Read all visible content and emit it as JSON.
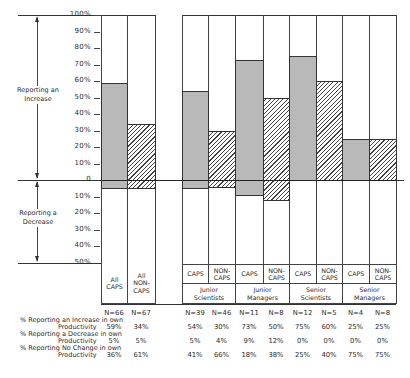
{
  "chart_data": {
    "type": "bar",
    "title": "",
    "xlabel": "",
    "ylabel": "",
    "y_axis": {
      "increase_ticks": [
        "100%",
        "90%",
        "80%",
        "70%",
        "60%",
        "50%",
        "40%",
        "30%",
        "20%",
        "10%"
      ],
      "zero_label": "0",
      "decrease_ticks": [
        "10%",
        "20%",
        "30%",
        "40%",
        "50%"
      ],
      "range_increase": [
        0,
        100
      ],
      "range_decrease": [
        0,
        50
      ]
    },
    "side_annotations": {
      "increase": "Reporting an Increase",
      "decrease": "Reporting a Decrease"
    },
    "legend": {
      "caps_fill": "gray",
      "noncaps_fill": "hatched"
    },
    "categories": [
      {
        "label": "All CAPS",
        "group": "",
        "type": "CAPS",
        "n": "N=66",
        "increase": 59,
        "decrease": 5,
        "no_change": 36
      },
      {
        "label": "All NON-CAPS",
        "group": "",
        "type": "NON-CAPS",
        "n": "N=67",
        "increase": 34,
        "decrease": 5,
        "no_change": 61
      },
      {
        "label": "CAPS",
        "group": "Junior Scientists",
        "type": "CAPS",
        "n": "N=39",
        "increase": 54,
        "decrease": 5,
        "no_change": 41
      },
      {
        "label": "NON-CAPS",
        "group": "Junior Scientists",
        "type": "NON-CAPS",
        "n": "N=46",
        "increase": 30,
        "decrease": 4,
        "no_change": 66
      },
      {
        "label": "CAPS",
        "group": "Junior Managers",
        "type": "CAPS",
        "n": "N=11",
        "increase": 73,
        "decrease": 9,
        "no_change": 18
      },
      {
        "label": "NON-CAPS",
        "group": "Junior Managers",
        "type": "NON-CAPS",
        "n": "N=8",
        "increase": 50,
        "decrease": 12,
        "no_change": 38
      },
      {
        "label": "CAPS",
        "group": "Senior Scientists",
        "type": "CAPS",
        "n": "N=12",
        "increase": 75,
        "decrease": 0,
        "no_change": 25
      },
      {
        "label": "NON-CAPS",
        "group": "Senior Scientists",
        "type": "NON-CAPS",
        "n": "N=5",
        "increase": 60,
        "decrease": 0,
        "no_change": 40
      },
      {
        "label": "CAPS",
        "group": "Senior Managers",
        "type": "CAPS",
        "n": "N=4",
        "increase": 25,
        "decrease": 0,
        "no_change": 75
      },
      {
        "label": "NON-CAPS",
        "group": "Senior Managers",
        "type": "NON-CAPS",
        "n": "N=8",
        "increase": 25,
        "decrease": 0,
        "no_change": 75
      }
    ],
    "table": {
      "rows": [
        {
          "label_line1": "% Reporting an Increase in own",
          "label_line2": "Productivity",
          "values": [
            "59%",
            "34%",
            "54%",
            "30%",
            "73%",
            "50%",
            "75%",
            "60%",
            "25%",
            "25%"
          ]
        },
        {
          "label_line1": "% Reporting a Decrease in own",
          "label_line2": "Productivity",
          "values": [
            "5%",
            "5%",
            "5%",
            "4%",
            "9%",
            "12%",
            "0%",
            "0%",
            "0%",
            "0%"
          ]
        },
        {
          "label_line1": "% Reporting No Change in own",
          "label_line2": "Productivity",
          "values": [
            "36%",
            "61%",
            "41%",
            "66%",
            "18%",
            "38%",
            "25%",
            "40%",
            "75%",
            "75%"
          ]
        }
      ],
      "n_values": [
        "N=66",
        "N=67",
        "N=39",
        "N=46",
        "N=11",
        "N=8",
        "N=12",
        "N=5",
        "N=4",
        "N=8"
      ]
    },
    "groups": [
      "Junior Scientists",
      "Junior Managers",
      "Senior Scientists",
      "Senior Managers"
    ],
    "column_labels": {
      "all_caps": "All\nCAPS",
      "all_noncaps": "All\nNON-\nCAPS",
      "caps": "CAPS",
      "noncaps": "NON-\nCAPS",
      "group_names": [
        "Junior\nScientists",
        "Junior\nManagers",
        "Senior\nScientists",
        "Senior\nManagers"
      ]
    },
    "colors": {
      "caps_gray": "#b9b9b9",
      "hatch_line": "#444444",
      "line": "#333333"
    }
  }
}
